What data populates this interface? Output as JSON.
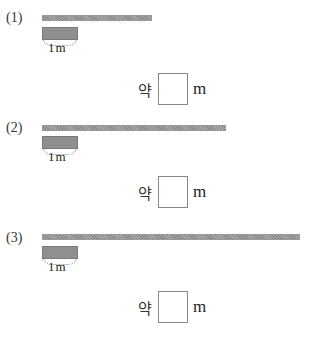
{
  "header": {
    "cut_text": ""
  },
  "problems": [
    {
      "number": "(1)",
      "bar_length_px": 110,
      "unit_label": "1m",
      "answer": {
        "approx_label": "약",
        "value": "",
        "unit": "m"
      }
    },
    {
      "number": "(2)",
      "bar_length_px": 184,
      "unit_label": "1m",
      "answer": {
        "approx_label": "약",
        "value": "",
        "unit": "m"
      }
    },
    {
      "number": "(3)",
      "bar_length_px": 258,
      "unit_label": "1m",
      "answer": {
        "approx_label": "약",
        "value": "",
        "unit": "m"
      }
    }
  ],
  "colors": {
    "bar": "#9a9a9a",
    "unit_box": "#8f8f8f",
    "answer_border": "#888888"
  }
}
